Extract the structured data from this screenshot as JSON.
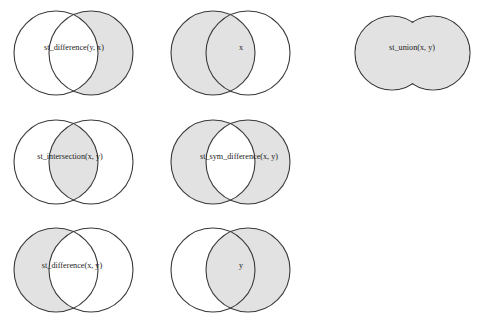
{
  "figure": {
    "title": "",
    "background_color": "#ffffff",
    "fill_color": "#e2e2e2",
    "stroke_color": "#3a3a3a",
    "label_color": "#1c1c1c",
    "columns": 3,
    "rows": 3,
    "panel_count": 6
  },
  "panels": [
    {
      "id": "st-difference-y-x",
      "label": "st_difference(y, x)",
      "row": 1,
      "column": 1,
      "shape": "two-circles",
      "shaded_region": "right-only",
      "left_circle": {
        "cx": 56,
        "cy": 53,
        "r": 42
      },
      "right_circle": {
        "cx": 91,
        "cy": 53,
        "r": 42
      },
      "label_x": 74,
      "label_y": 48
    },
    {
      "id": "x",
      "label": "x",
      "row": 1,
      "column": 2,
      "shape": "two-circles",
      "shaded_region": "left-full",
      "left_circle": {
        "cx": 213,
        "cy": 53,
        "r": 42
      },
      "right_circle": {
        "cx": 248,
        "cy": 53,
        "r": 42
      },
      "label_x": 241,
      "label_y": 48
    },
    {
      "id": "st-union-x-y",
      "label": "st_union(x, y)",
      "row": 1,
      "column": 3,
      "shape": "union-blob",
      "shaded_region": "both-merged",
      "left_circle": {
        "cx": 392,
        "cy": 53,
        "r": 37
      },
      "right_circle": {
        "cx": 433,
        "cy": 53,
        "r": 37
      },
      "label_x": 412,
      "label_y": 48
    },
    {
      "id": "st-intersection-x-y",
      "label": "st_intersection(x, y)",
      "row": 2,
      "column": 1,
      "shape": "two-circles",
      "shaded_region": "intersection",
      "left_circle": {
        "cx": 56,
        "cy": 162,
        "r": 42
      },
      "right_circle": {
        "cx": 91,
        "cy": 162,
        "r": 42
      },
      "label_x": 70,
      "label_y": 157
    },
    {
      "id": "st-sym-difference-x-y",
      "label": "st_sym_difference(x, y)",
      "row": 2,
      "column": 2,
      "shape": "two-circles",
      "shaded_region": "symmetric-difference",
      "left_circle": {
        "cx": 213,
        "cy": 162,
        "r": 42
      },
      "right_circle": {
        "cx": 248,
        "cy": 162,
        "r": 42
      },
      "label_x": 239,
      "label_y": 157
    },
    {
      "id": "st-difference-x-y",
      "label": "st_difference(x, y)",
      "row": 3,
      "column": 1,
      "shape": "two-circles",
      "shaded_region": "left-only",
      "left_circle": {
        "cx": 56,
        "cy": 270,
        "r": 42
      },
      "right_circle": {
        "cx": 91,
        "cy": 270,
        "r": 42
      },
      "label_x": 72,
      "label_y": 266
    },
    {
      "id": "y",
      "label": "y",
      "row": 3,
      "column": 2,
      "shape": "two-circles",
      "shaded_region": "right-full",
      "left_circle": {
        "cx": 213,
        "cy": 270,
        "r": 42
      },
      "right_circle": {
        "cx": 248,
        "cy": 270,
        "r": 42
      },
      "label_x": 241,
      "label_y": 266
    }
  ]
}
